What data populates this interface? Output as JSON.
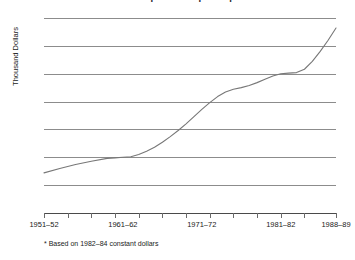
{
  "chart_data": {
    "type": "line",
    "title": "Annual Expenditure per Pupil*",
    "title_cropped": true,
    "xlabel": "",
    "ylabel": "Thousand Dollars",
    "ylim": [
      0.0,
      3.5
    ],
    "yticks": [
      "0.0",
      "0.5",
      "1.0",
      "1.5",
      "2.0",
      "2.5",
      "3.0",
      "3.5"
    ],
    "ytick_values": [
      0.0,
      0.5,
      1.0,
      1.5,
      2.0,
      2.5,
      3.0,
      3.5
    ],
    "grid": true,
    "legend": "none",
    "footnote": "* Based on 1982–84 constant dollars",
    "xtick_labels": [
      "1951–52",
      "1961–62",
      "1971–72",
      "1981–82",
      "1988–89"
    ],
    "xtick_label_years": [
      1951,
      1961,
      1971,
      1981,
      1988
    ],
    "xlim_years": [
      1951,
      1988
    ],
    "minor_tick_years": [
      1951,
      1954,
      1957,
      1960,
      1963,
      1966,
      1969,
      1972,
      1975,
      1978,
      1981,
      1984,
      1988
    ],
    "series": [
      {
        "name": "Annual expenditure per pupil",
        "color": "#777777",
        "x": [
          1951,
          1953,
          1955,
          1957,
          1959,
          1960,
          1961,
          1962,
          1963,
          1964,
          1965,
          1966,
          1967,
          1968,
          1969,
          1970,
          1971,
          1972,
          1973,
          1974,
          1975,
          1976,
          1977,
          1978,
          1979,
          1980,
          1981,
          1982,
          1983,
          1984,
          1985,
          1986,
          1987,
          1988
        ],
        "values": [
          0.72,
          0.8,
          0.87,
          0.93,
          0.98,
          0.99,
          1.0,
          1.01,
          1.05,
          1.11,
          1.18,
          1.27,
          1.37,
          1.48,
          1.6,
          1.73,
          1.86,
          1.98,
          2.09,
          2.17,
          2.22,
          2.25,
          2.29,
          2.34,
          2.4,
          2.46,
          2.5,
          2.51,
          2.52,
          2.58,
          2.72,
          2.9,
          3.1,
          3.32
        ]
      }
    ]
  }
}
